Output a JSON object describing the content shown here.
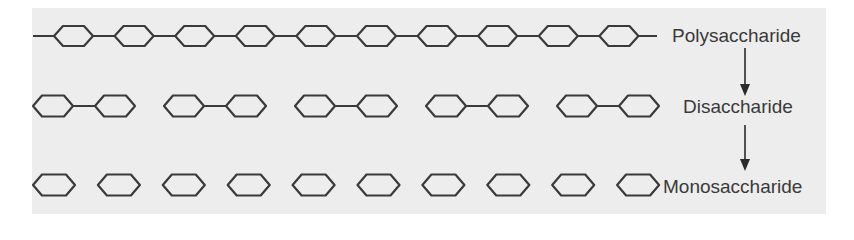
{
  "diagram": {
    "colors": {
      "background": "#ededed",
      "stroke": "#3a3a3a",
      "text": "#3a3a3a"
    },
    "rows": [
      {
        "label": "Polysaccharide",
        "type": "chain",
        "units": 10
      },
      {
        "label": "Disaccharide",
        "type": "pairs",
        "pairs": 5
      },
      {
        "label": "Monosaccharide",
        "type": "singles",
        "units": 10
      }
    ],
    "arrows": [
      {
        "from": "Polysaccharide",
        "to": "Disaccharide"
      },
      {
        "from": "Disaccharide",
        "to": "Monosaccharide"
      }
    ]
  }
}
